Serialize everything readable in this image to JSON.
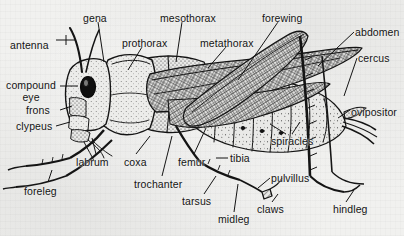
{
  "figure": {
    "style": "scanned black-and-white stippled line engraving",
    "background_color": "#f1f1ef",
    "ink_color": "#141414",
    "label_count": 24
  },
  "labels": [
    {
      "id": "antenna",
      "text": "antenna",
      "x": 10,
      "y": 40,
      "align": "left",
      "lines": 1
    },
    {
      "id": "gena",
      "text": "gena",
      "x": 83,
      "y": 13,
      "align": "left",
      "lines": 1
    },
    {
      "id": "prothorax",
      "text": "prothorax",
      "x": 122,
      "y": 38,
      "align": "left",
      "lines": 1
    },
    {
      "id": "mesothorax",
      "text": "mesothorax",
      "x": 160,
      "y": 13,
      "align": "left",
      "lines": 1
    },
    {
      "id": "metathorax",
      "text": "metathorax",
      "x": 200,
      "y": 38,
      "align": "left",
      "lines": 1
    },
    {
      "id": "forewing",
      "text": "forewing",
      "x": 262,
      "y": 13,
      "align": "left",
      "lines": 1
    },
    {
      "id": "abdomen",
      "text": "abdomen",
      "x": 355,
      "y": 27,
      "align": "left",
      "lines": 1
    },
    {
      "id": "cercus",
      "text": "cercus",
      "x": 358,
      "y": 53,
      "align": "left",
      "lines": 1
    },
    {
      "id": "ovipositor",
      "text": "ovipositor",
      "x": 351,
      "y": 107,
      "align": "left",
      "lines": 1
    },
    {
      "id": "compound-eye",
      "text": "compound\neye",
      "x": 8,
      "y": 80,
      "align": "center",
      "lines": 2
    },
    {
      "id": "frons",
      "text": "frons",
      "x": 34,
      "y": 107,
      "align": "left",
      "lines": 1
    },
    {
      "id": "clypeus",
      "text": "clypeus",
      "x": 23,
      "y": 123,
      "align": "left",
      "lines": 1
    },
    {
      "id": "labrum",
      "text": "labrum",
      "x": 76,
      "y": 158,
      "align": "left",
      "lines": 1
    },
    {
      "id": "foreleg",
      "text": "foreleg",
      "x": 24,
      "y": 186,
      "align": "left",
      "lines": 1
    },
    {
      "id": "coxa",
      "text": "coxa",
      "x": 125,
      "y": 158,
      "align": "left",
      "lines": 1
    },
    {
      "id": "trochanter",
      "text": "trochanter",
      "x": 136,
      "y": 180,
      "align": "left",
      "lines": 1
    },
    {
      "id": "femur",
      "text": "femur",
      "x": 178,
      "y": 158,
      "align": "left",
      "lines": 1
    },
    {
      "id": "tibia",
      "text": "tibia",
      "x": 230,
      "y": 155,
      "align": "left",
      "lines": 1
    },
    {
      "id": "tarsus",
      "text": "tarsus",
      "x": 184,
      "y": 197,
      "align": "left",
      "lines": 1
    },
    {
      "id": "midleg",
      "text": "midleg",
      "x": 220,
      "y": 215,
      "align": "left",
      "lines": 1
    },
    {
      "id": "pulvillus",
      "text": "pulvillus",
      "x": 272,
      "y": 174,
      "align": "left",
      "lines": 1
    },
    {
      "id": "claws",
      "text": "claws",
      "x": 258,
      "y": 205,
      "align": "left",
      "lines": 1
    },
    {
      "id": "spiracles",
      "text": "spiracles",
      "x": 272,
      "y": 137,
      "align": "left",
      "lines": 1
    },
    {
      "id": "hindleg",
      "text": "hindleg",
      "x": 334,
      "y": 205,
      "align": "left",
      "lines": 1
    }
  ],
  "anatomy_parts": [
    "antenna",
    "gena",
    "prothorax",
    "mesothorax",
    "metathorax",
    "forewing",
    "abdomen",
    "cercus",
    "ovipositor",
    "compound eye",
    "frons",
    "clypeus",
    "labrum",
    "foreleg",
    "coxa",
    "trochanter",
    "femur",
    "tibia",
    "tarsus",
    "midleg",
    "pulvillus",
    "claws",
    "spiracles",
    "hindleg"
  ]
}
